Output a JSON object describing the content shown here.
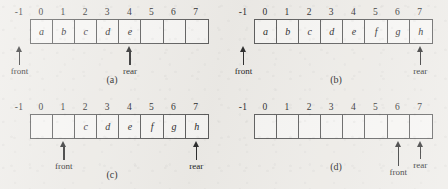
{
  "figure": {
    "negative_index_label": "-1",
    "indices": [
      "0",
      "1",
      "2",
      "3",
      "4",
      "5",
      "6",
      "7"
    ],
    "ink_color": "#2e2e2e",
    "cell_border_color": "#5d5d5d",
    "paper_color": "#eeece8",
    "cell_fill_color": "#f7f6f4"
  },
  "panels": [
    {
      "id": "a",
      "caption": "(a)",
      "cells": [
        "a",
        "b",
        "c",
        "d",
        "e",
        "",
        "",
        ""
      ],
      "pointers": [
        {
          "name": "front",
          "label": "front",
          "index": -1
        },
        {
          "name": "rear",
          "label": "rear",
          "index": 4
        }
      ]
    },
    {
      "id": "b",
      "caption": "(b)",
      "cells": [
        "a",
        "b",
        "c",
        "d",
        "e",
        "f",
        "g",
        "h"
      ],
      "pointers": [
        {
          "name": "front",
          "label": "front",
          "index": -1
        },
        {
          "name": "rear",
          "label": "rear",
          "index": 7
        }
      ]
    },
    {
      "id": "c",
      "caption": "(c)",
      "cells": [
        "",
        "",
        "c",
        "d",
        "e",
        "f",
        "g",
        "h"
      ],
      "pointers": [
        {
          "name": "front",
          "label": "front",
          "index": 1
        },
        {
          "name": "rear",
          "label": "rear",
          "index": 7
        }
      ]
    },
    {
      "id": "d",
      "caption": "(d)",
      "cells": [
        "",
        "",
        "",
        "",
        "",
        "",
        "",
        ""
      ],
      "pointers": [
        {
          "name": "front",
          "label": "front",
          "index": 6
        },
        {
          "name": "rear",
          "label": "rear",
          "index": 7
        }
      ]
    }
  ]
}
